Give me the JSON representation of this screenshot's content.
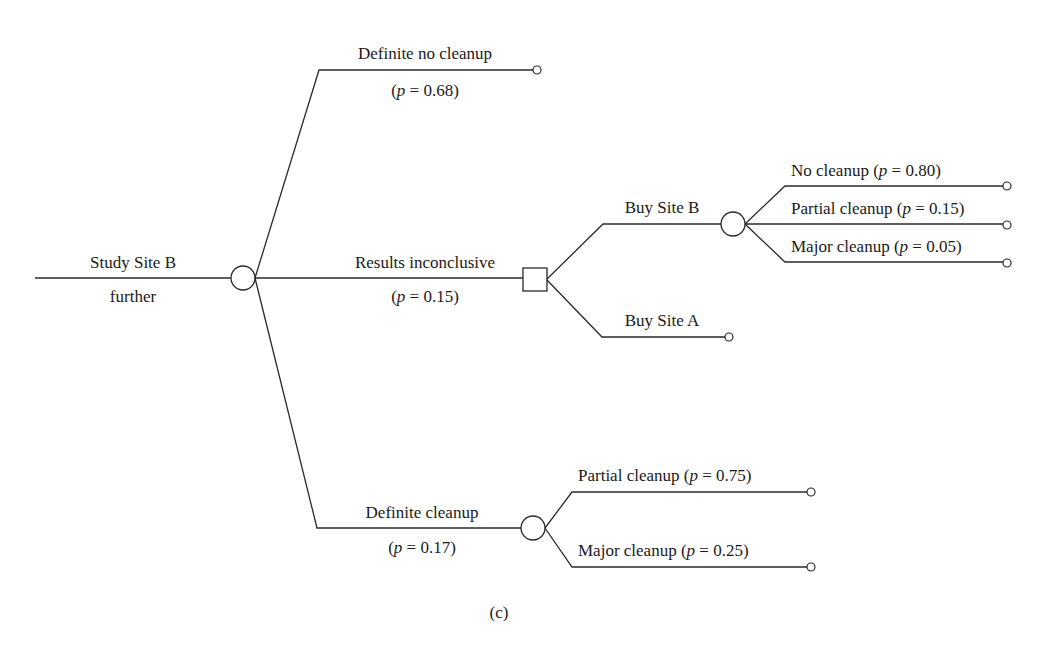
{
  "diagram": {
    "type": "decision-tree",
    "caption": "(c)",
    "root": {
      "label_top": "Study Site B",
      "label_bottom": "further"
    },
    "chance_1": {
      "branches": [
        {
          "label": "Definite no cleanup",
          "prob": "(p = 0.68)",
          "p_prefix": "(",
          "p_var": "p",
          "p_suffix": " = 0.68)"
        },
        {
          "label": "Results inconclusive",
          "prob": "(p = 0.15)",
          "p_prefix": "(",
          "p_var": "p",
          "p_suffix": " = 0.15)"
        },
        {
          "label": "Definite cleanup",
          "prob": "(p = 0.17)",
          "p_prefix": "(",
          "p_var": "p",
          "p_suffix": " = 0.17)"
        }
      ]
    },
    "decision_1": {
      "branches": [
        {
          "label": "Buy Site B"
        },
        {
          "label": "Buy Site A"
        }
      ]
    },
    "chance_buyB": {
      "branches": [
        {
          "label": "No cleanup (",
          "p_var": "p",
          "p_suffix": " = 0.80)"
        },
        {
          "label": "Partial cleanup (",
          "p_var": "p",
          "p_suffix": " = 0.15)"
        },
        {
          "label": "Major cleanup (",
          "p_var": "p",
          "p_suffix": " = 0.05)"
        }
      ]
    },
    "chance_cleanup": {
      "branches": [
        {
          "label": "Partial cleanup (",
          "p_var": "p",
          "p_suffix": " = 0.75)"
        },
        {
          "label": "Major cleanup (",
          "p_var": "p",
          "p_suffix": " = 0.25)"
        }
      ]
    }
  }
}
